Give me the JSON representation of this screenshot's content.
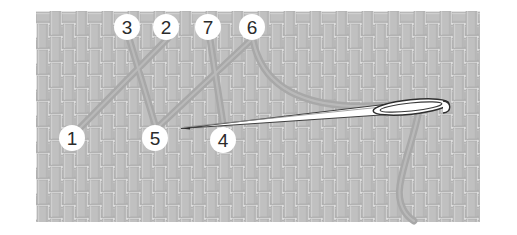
{
  "figure": {
    "type": "embroidery-stitch-diagram",
    "canvas": {
      "width": 517,
      "height": 235
    },
    "background_color": "#ffffff"
  },
  "fabric": {
    "name": "basketweave-fabric",
    "x": 36,
    "y": 11,
    "width": 444,
    "height": 211,
    "thread_color": "#c0c0c0",
    "thread_shadow_color": "#a6a6a6",
    "gap_color": "#ffffff",
    "cell": 13,
    "weave_label": "plain basket weave"
  },
  "stitch_thread": {
    "name": "embroidery-thread",
    "color": "#a8a8a8",
    "highlight_color": "#b9b9b9",
    "width": 7,
    "description": "Gray working thread forming crossed herringbone stitches"
  },
  "needle": {
    "name": "sewing-needle",
    "body_color": "#ffffff",
    "outline_color": "#3a3a3a",
    "eye_color": "#ffffff",
    "tip": {
      "x": 181,
      "y": 128
    },
    "eye": {
      "x": 420,
      "y": 109
    },
    "label": "threaded needle"
  },
  "points": [
    {
      "id": 1,
      "label": "1",
      "cx": 72,
      "cy": 138,
      "r": 13,
      "role": "entry-point"
    },
    {
      "id": 2,
      "label": "2",
      "cx": 166,
      "cy": 27,
      "r": 13,
      "role": "exit-point"
    },
    {
      "id": 3,
      "label": "3",
      "cx": 127,
      "cy": 27,
      "r": 13,
      "role": "entry-point"
    },
    {
      "id": 4,
      "label": "4",
      "cx": 223,
      "cy": 140,
      "r": 13,
      "role": "exit-point"
    },
    {
      "id": 5,
      "label": "5",
      "cx": 155,
      "cy": 138,
      "r": 13,
      "role": "entry-point"
    },
    {
      "id": 6,
      "label": "6",
      "cx": 252,
      "cy": 27,
      "r": 13,
      "role": "exit-point"
    },
    {
      "id": 7,
      "label": "7",
      "cx": 208,
      "cy": 27,
      "r": 13,
      "role": "entry-point"
    }
  ],
  "point_marker": {
    "fill": "#ffffff",
    "text_color": "#2b2b2b",
    "font_size": 19
  },
  "sequence_note": "Numbers 1-7 mark the order the needle enters and exits the fabric"
}
